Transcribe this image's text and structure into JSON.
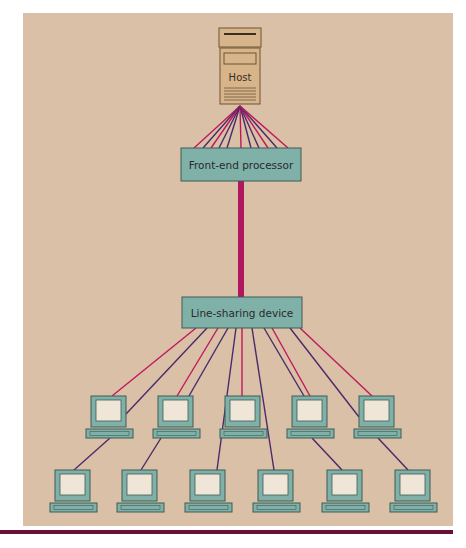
{
  "diagram": {
    "colors": {
      "page_background": "#ffffff",
      "panel_background": "#d9c0a6",
      "box_fill": "#7fb1a8",
      "box_stroke": "#3f5a55",
      "host_fill": "#d7b48a",
      "host_stroke": "#6b5637",
      "line_magenta": "#c2185b",
      "line_purple": "#4a2a6a",
      "trunk": "#b0175e",
      "bottom_bar": "#6a0f3a",
      "monitor_frame": "#7fb1a8",
      "screen": "#efe6d8"
    },
    "nodes": {
      "host": {
        "label": "Host",
        "icon": "server-icon"
      },
      "front_end_processor": {
        "label": "Front-end processor"
      },
      "line_sharing_device": {
        "label": "Line-sharing device"
      }
    },
    "terminals": {
      "row1_count": 5,
      "row2_count": 6,
      "total": 11,
      "icon": "computer-terminal-icon"
    },
    "connections": [
      {
        "from": "host",
        "to": "front_end_processor",
        "type": "multiple lines (fan)",
        "count": 11
      },
      {
        "from": "front_end_processor",
        "to": "line_sharing_device",
        "type": "single high-speed trunk line"
      },
      {
        "from": "line_sharing_device",
        "to": "terminals",
        "type": "individual lines",
        "count": 11
      }
    ]
  }
}
